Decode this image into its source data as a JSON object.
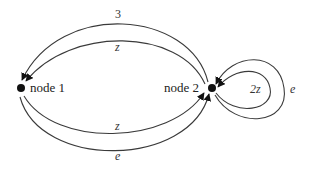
{
  "diagram": {
    "type": "state-transition-graph",
    "nodes": [
      {
        "id": "node1",
        "label": "node 1"
      },
      {
        "id": "node2",
        "label": "node 2"
      }
    ],
    "edges": [
      {
        "from": "node2",
        "to": "node1",
        "label": "3",
        "position": "top-outer"
      },
      {
        "from": "node2",
        "to": "node1",
        "label": "z",
        "position": "top-inner"
      },
      {
        "from": "node1",
        "to": "node2",
        "label": "z",
        "position": "bottom-inner"
      },
      {
        "from": "node1",
        "to": "node2",
        "label": "e",
        "position": "bottom-outer"
      },
      {
        "from": "node2",
        "to": "node2",
        "label": "2z",
        "position": "self-loop-inner"
      },
      {
        "from": "node2",
        "to": "node2",
        "label": "e",
        "position": "self-loop-outer"
      }
    ],
    "colors": {
      "edge": "#3a3a3a",
      "node": "#111111",
      "text": "#222222"
    }
  }
}
